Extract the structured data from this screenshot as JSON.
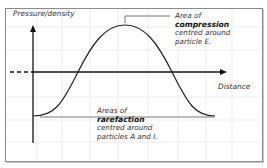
{
  "diagram": {
    "type": "longitudinal wave pressure/density graph",
    "y_axis_label": "Pressure/density",
    "x_axis_label": "Distance",
    "annotations": {
      "compression": {
        "line1": "Area of",
        "line2": "compression",
        "line3": "centred around",
        "line4": "particle E."
      },
      "rarefaction": {
        "line1": "Areas of",
        "line2": "rarefaction",
        "line3": "centred around",
        "line4": "particles A and I."
      }
    },
    "colors": {
      "curve": "#222222",
      "axes": "#111111",
      "grid": "#e6e6e6",
      "frame": "#8a8a8a",
      "text": "#333333"
    }
  }
}
